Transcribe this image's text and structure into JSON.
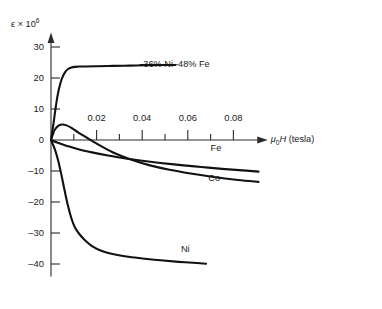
{
  "chart_data": {
    "type": "line",
    "title": "",
    "subtitle": "",
    "xlabel": "μ₀H (tesla)",
    "xlabel_parts": {
      "mu": "μ",
      "zero": "0",
      "H": "H",
      "unit": "(tesla)"
    },
    "ylabel": "ε × 10⁶",
    "ylabel_parts": {
      "epsilon": "ε",
      "times": "×",
      "base": "10",
      "exponent": "6"
    },
    "xlim": [
      0,
      0.092
    ],
    "ylim": [
      -44,
      34
    ],
    "grid": false,
    "legend_position": "inline-curve-labels",
    "xticks": [
      0.02,
      0.04,
      0.06,
      0.08
    ],
    "xtick_labels": [
      "0.02",
      "0.04",
      "0.06",
      "0.08"
    ],
    "xminorticks": [
      0.01,
      0.03,
      0.05,
      0.07
    ],
    "yticks": [
      30,
      20,
      10,
      0,
      -10,
      -20,
      -30,
      -40
    ],
    "ytick_labels": [
      "30",
      "20",
      "10",
      "0",
      "–10",
      "–20",
      "–30",
      "–40"
    ],
    "series": [
      {
        "name": "36% Ni–48% Fe",
        "label": "36% Ni–48% Fe",
        "label_x": 0.0405,
        "label_y": 24.2,
        "leader_line": true,
        "x": [
          0,
          0.001,
          0.002,
          0.003,
          0.004,
          0.005,
          0.0062,
          0.0075,
          0.009,
          0.0105,
          0.0125,
          0.015,
          0.02,
          0.027,
          0.0345,
          0.042,
          0.05,
          0.0545
        ],
        "y": [
          0,
          4.8,
          10.2,
          14.8,
          18.0,
          20.2,
          21.9,
          22.9,
          23.4,
          23.6,
          23.7,
          23.7,
          23.8,
          23.9,
          24.0,
          24.1,
          24.2,
          24.2
        ]
      },
      {
        "name": "Fe",
        "label": "Fe",
        "label_x": 0.07,
        "label_y": -3.0,
        "leader_line": false,
        "x": [
          0,
          0.003,
          0.007,
          0.012,
          0.018,
          0.025,
          0.032,
          0.04,
          0.048,
          0.057,
          0.066,
          0.075,
          0.084,
          0.091
        ],
        "y": [
          0,
          -0.9,
          -1.9,
          -3.0,
          -4.0,
          -5.0,
          -5.9,
          -6.7,
          -7.4,
          -8.1,
          -8.7,
          -9.3,
          -9.8,
          -10.2
        ]
      },
      {
        "name": "Co",
        "label": "Co",
        "label_x": 0.069,
        "label_y": -12.6,
        "leader_line": false,
        "x": [
          0,
          0.0015,
          0.003,
          0.0048,
          0.0065,
          0.009,
          0.012,
          0.016,
          0.018,
          0.022,
          0.028,
          0.035,
          0.043,
          0.052,
          0.062,
          0.072,
          0.082,
          0.091
        ],
        "y": [
          0,
          3.1,
          4.5,
          5.0,
          4.8,
          3.9,
          2.4,
          0.6,
          -0.3,
          -2.0,
          -4.3,
          -6.3,
          -8.1,
          -9.6,
          -10.9,
          -12.0,
          -12.9,
          -13.5
        ]
      },
      {
        "name": "Ni",
        "label": "Ni",
        "label_x": 0.057,
        "label_y": -35.6,
        "leader_line": false,
        "x": [
          0,
          0.0015,
          0.003,
          0.0045,
          0.006,
          0.0075,
          0.009,
          0.0105,
          0.0125,
          0.015,
          0.018,
          0.022,
          0.027,
          0.033,
          0.04,
          0.048,
          0.056,
          0.064,
          0.068
        ],
        "y": [
          0,
          -2.6,
          -6.2,
          -11.0,
          -16.4,
          -21.4,
          -25.4,
          -28.2,
          -30.4,
          -32.4,
          -34.2,
          -35.7,
          -36.8,
          -37.6,
          -38.2,
          -38.8,
          -39.3,
          -39.7,
          -39.9
        ]
      }
    ]
  },
  "colors": {
    "curve": "#111111",
    "axis": "#2b2b2b",
    "text": "#1a1a1a",
    "background": "#ffffff"
  }
}
